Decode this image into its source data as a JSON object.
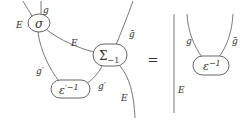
{
  "diagram": {
    "left": {
      "nodes": {
        "sigma": "σ",
        "Sigma_main": "Σ",
        "Sigma_sub": "−1",
        "eps_prime_main": "ε",
        "eps_prime_sup": "′−1"
      },
      "wire_labels": {
        "E_top_left": "E",
        "g_top": "g",
        "E_middle": "E",
        "gbar_top_right": "ḡ",
        "g_prime_left": "g′",
        "g_prime_right": "g′",
        "E_bottom_right": "E"
      }
    },
    "equals": "=",
    "right": {
      "nodes": {
        "eps_main": "ε",
        "eps_sup": "−1"
      },
      "wire_labels": {
        "E_vertical": "E",
        "g": "g",
        "gbar": "ḡ"
      }
    },
    "colors": {
      "wire": "#6b6b6b",
      "node_border": "#555555",
      "text": "#333333",
      "background": "#ffffff"
    }
  }
}
